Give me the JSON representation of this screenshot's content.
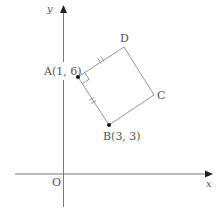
{
  "axes": {
    "x_label": "x",
    "y_label": "y",
    "origin_label": "O"
  },
  "points": {
    "A": {
      "label": "A(1, 6)",
      "x": 1,
      "y": 6
    },
    "B": {
      "label": "B(3, 3)",
      "x": 3,
      "y": 3
    },
    "C": {
      "label": "C"
    },
    "D": {
      "label": "D"
    }
  },
  "figure": {
    "shape": "square ABCD",
    "marks": "right angle at A; AB and AD marked equal"
  },
  "colors": {
    "line": "#8a8a8a",
    "text": "#555555",
    "point": "#111111"
  }
}
